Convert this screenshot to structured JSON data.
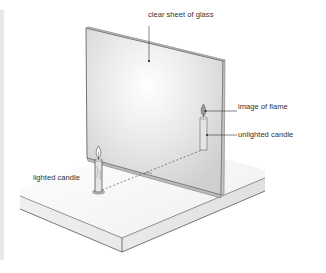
{
  "diagram": {
    "labels": {
      "glass": "clear sheet of glass",
      "image_flame": "image of flame",
      "unlighted_candle": "unlighted candle",
      "lighted_candle": "lighted candle"
    },
    "colors": {
      "line": "#555555",
      "glass_fill": "#dcdcdc",
      "platform_top": "#ececec",
      "platform_front": "#d6d6d6",
      "candle": "#e6e6e6"
    }
  }
}
